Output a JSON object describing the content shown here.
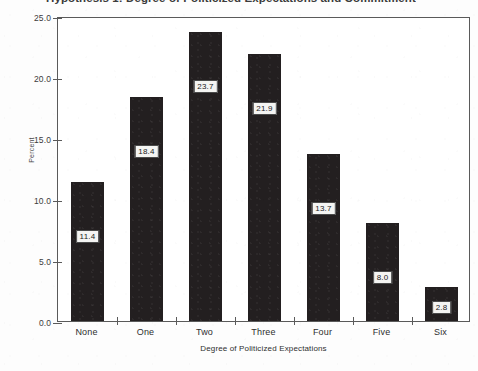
{
  "title": {
    "text": "Hypothesis 1: Degree of Politicized Expectations and Commitment",
    "note": "cropped-at-top"
  },
  "chart_data": {
    "type": "bar",
    "title": "Hypothesis 1: Degree of Politicized Expectations and Commitment",
    "categories": [
      "None",
      "One",
      "Two",
      "Three",
      "Four",
      "Five",
      "Six"
    ],
    "values": [
      11.4,
      18.4,
      23.7,
      21.9,
      13.7,
      8.0,
      2.8
    ],
    "value_labels": [
      "11.4",
      "18.4",
      "23.7",
      "21.9",
      "13.7",
      "8.0",
      "2.8"
    ],
    "xlabel": "Degree of Politicized Expectations",
    "ylabel": "Percent",
    "ylim": [
      0.0,
      25.0
    ],
    "ytick_values": [
      0.0,
      5.0,
      10.0,
      15.0,
      20.0,
      25.0
    ],
    "ytick_labels": [
      "0.0",
      "5.0",
      "10.0",
      "15.0",
      "20.0",
      "25.0"
    ],
    "grid": false,
    "legend": null,
    "bar_color": "#231f20",
    "plot_background": "#ffffff",
    "frame_color": "#5a5a5a"
  }
}
